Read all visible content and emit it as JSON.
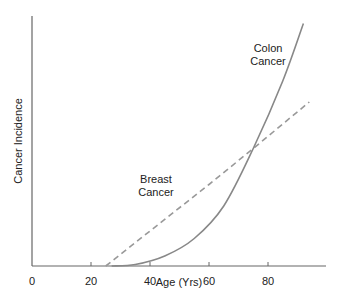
{
  "chart_data": {
    "type": "line",
    "title": "",
    "xlabel": "Age (Yrs)",
    "ylabel": "Cancer Incidence",
    "xlim": [
      0,
      100
    ],
    "ylim": [
      0,
      100
    ],
    "xticks": [
      0,
      20,
      40,
      60,
      80
    ],
    "xtick_labels": [
      "0",
      "20",
      "40",
      "60",
      "80"
    ],
    "yticks": [],
    "grid": false,
    "legend": "none (inline labels)",
    "series": [
      {
        "name": "Breast Cancer",
        "style": "dashed",
        "color": "#999999",
        "label_lines": [
          "Breast",
          "Cancer"
        ],
        "points": [
          [
            25,
            0
          ],
          [
            40,
            14
          ],
          [
            60,
            32.6
          ],
          [
            75,
            47
          ],
          [
            94,
            65.6
          ]
        ]
      },
      {
        "name": "Colon Cancer",
        "style": "solid",
        "color": "#888888",
        "label_lines": [
          "Colon",
          "Cancer"
        ],
        "points": [
          [
            27,
            0
          ],
          [
            35,
            0.6
          ],
          [
            45,
            4
          ],
          [
            55,
            11
          ],
          [
            65,
            24
          ],
          [
            75,
            47
          ],
          [
            85,
            74
          ],
          [
            92,
            97
          ]
        ]
      }
    ]
  }
}
